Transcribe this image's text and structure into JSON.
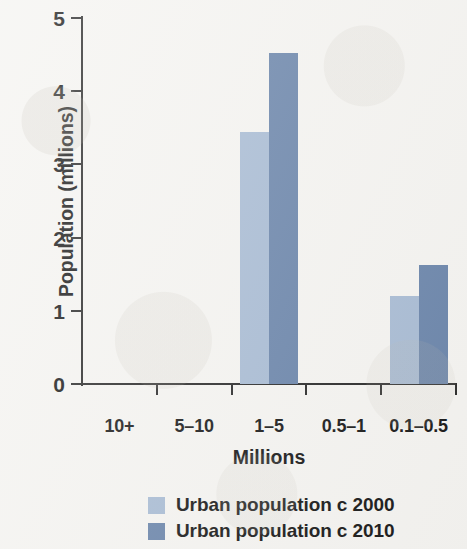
{
  "chart_data": {
    "type": "bar",
    "title": "",
    "xlabel": "Millions",
    "ylabel": "Population (millions)",
    "categories": [
      "10+",
      "5–10",
      "1–5",
      "0.5–1",
      "0.1–0.5"
    ],
    "series": [
      {
        "name": "Urban population c 2000",
        "color": "#a9bcd4",
        "values": [
          0,
          0,
          3.44,
          0,
          1.2
        ]
      },
      {
        "name": "Urban population c 2010",
        "color": "#6c86ab",
        "values": [
          0,
          0,
          4.52,
          0,
          1.63
        ]
      }
    ],
    "ylim": [
      0,
      5
    ],
    "yticks": [
      0,
      1,
      2,
      3,
      4,
      5
    ],
    "ytick_labels": [
      "0",
      "1",
      "2",
      "3",
      "4",
      "5"
    ],
    "grid": false,
    "legend_position": "bottom"
  },
  "axes": {
    "y_title": "Population (millions)",
    "x_title": "Millions"
  },
  "legend": {
    "items": [
      {
        "label": "Urban population c 2000",
        "color": "#a9bcd4"
      },
      {
        "label": "Urban population c 2010",
        "color": "#6c86ab"
      }
    ]
  }
}
